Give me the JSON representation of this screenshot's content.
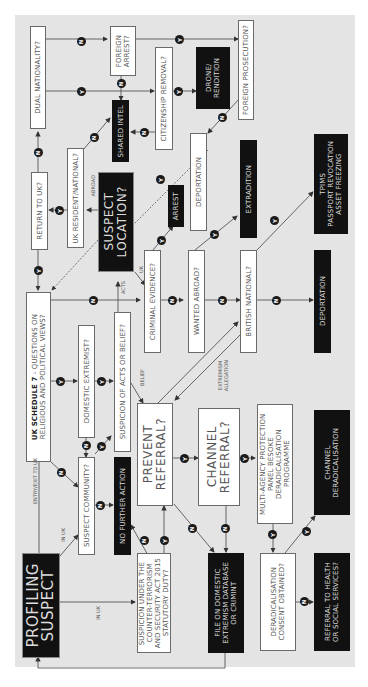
{
  "diagram": {
    "orientation": "rotated 90° counter-clockwise (text reads bottom-to-top)",
    "start_node": "PROFILING SUSPECT",
    "nodes": {
      "profiling_suspect": "PROFILING\nSUSPECT",
      "suspicion_ct_act": "SUSPICION UNDER THE\nCOUNTER-TERRORISM\nAND SECURITY ACT 2015\nSTATUTORY DUTY?",
      "file_database": "FILE ON DOMESTIC\nEXTREMISM DATABASE\nOR CRIMINT",
      "deradicalisation_consent": "DERADICALISATION\nCONSENT OBTAINED?",
      "referral_health": "REFERRAL TO HEALTH\nOR SOCIAL SERVICES?",
      "suspect_community": "SUSPECT COMMUNITY?",
      "no_further_action": "NO FURTHER ACTION",
      "prevent_referral": "PREVENT\nREFERRAL?",
      "channel_referral": "CHANNEL\nREFERRAL?",
      "multi_agency": "MULTI-AGENCY PROTECTION\nPANEL BESOKE DERADICALISATION\nPROGRAMME",
      "channel_deradicalisation": "CHANNEL\nDERADICALISATION",
      "uk_schedule7_bold": "UK SCHEDULE 7",
      "uk_schedule7_rest": " - QUESTIONS ON\nRELIGIOUS AND POLITICAL VIEWS?",
      "domestic_extremist": "DOMESTIC EXTREMIST?",
      "suspicion_acts_belief": "SUSPICION OF ACTS OR BELIEF?",
      "criminal_evidence": "CRIMINAL EVIDENCE?",
      "wanted_abroad": "WANTED ABROAD?",
      "british_national": "BRITISH NATIONAL?",
      "deportation_bottom": "DEPORTATION",
      "tpims": "TPIMS\nPASSPORT REVOCATION\nASSET FREEZING",
      "extradition": "EXTRADITION",
      "arrest": "ARREST",
      "deportation_top": "DEPORTATION",
      "suspect_location": "SUSPECT\nLOCATION?",
      "return_to_uk": "RETURN TO UK?",
      "uk_resident": "UK RESIDENT/NATIONAL?",
      "shared_intel": "SHARED INTEL",
      "dual_nationality": "DUAL NATIONALITY?",
      "foreign_arrest": "FOREIGN\nARREST?",
      "citizenship_removal": "CITIZENSHIP REMOVAL?",
      "drone_rendition": "DRONE/\nRENDITION",
      "foreign_prosecution": "FOREIGN PROSECUTION?"
    },
    "edge_labels": {
      "entry_exit": "ENTRY/EXIT TO UK",
      "in_uk_1": "IN UK",
      "in_uk_2": "IN UK",
      "acts": "ACTS",
      "belief": "BELIEF",
      "uk": "UK",
      "abroad": "ABROAD",
      "extremism_allegation": "EXTREMISM\nALLEGATION"
    },
    "badges": {
      "yes": "Y",
      "no": "N"
    },
    "colors": {
      "panel": "#e4e4e4",
      "black_box": "#111111",
      "white_box": "#ffffff",
      "line": "#555555"
    }
  }
}
